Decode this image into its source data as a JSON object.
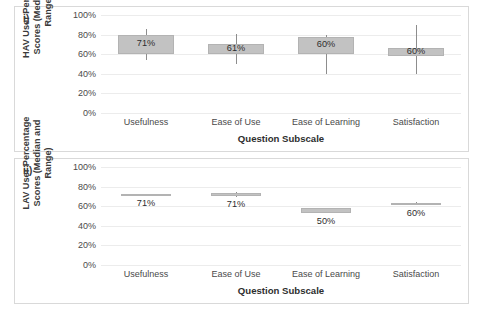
{
  "figure": {
    "background": "#ffffff",
    "box_fill": "#c2c2c2",
    "whisker_color": "#8d8d8d",
    "grid_color": "#ececec"
  },
  "panels": [
    {
      "tag": "i)",
      "y_title": "HAV User Percentage Scores (Median and Range)",
      "x_title": "Question Subscale",
      "chart_data": {
        "type": "bar",
        "subtype": "box-and-whisker",
        "title": "",
        "xlabel": "Question Subscale",
        "ylabel": "HAV User Percentage Scores (Median and Range)",
        "ylim": [
          0,
          100
        ],
        "yticks": [
          "0%",
          "20%",
          "40%",
          "60%",
          "80%",
          "100%"
        ],
        "ytick_values": [
          0,
          20,
          40,
          60,
          80,
          100
        ],
        "grid": true,
        "legend": "none",
        "categories": [
          "Usefulness",
          "Ease of Use",
          "Ease of Learning",
          "Satisfaction"
        ],
        "data_labels": [
          "71%",
          "61%",
          "60%",
          "60%"
        ],
        "values": [
          71,
          61,
          60,
          60
        ],
        "boxes": [
          {
            "category": "Usefulness",
            "box_low": 60,
            "box_high": 80,
            "whisker_low": 54,
            "whisker_high": 86,
            "label": "71%"
          },
          {
            "category": "Ease of Use",
            "box_low": 60,
            "box_high": 70,
            "whisker_low": 50,
            "whisker_high": 81,
            "label": "61%"
          },
          {
            "category": "Ease of Learning",
            "box_low": 60,
            "box_high": 78,
            "whisker_low": 40,
            "whisker_high": 80,
            "label": "60%"
          },
          {
            "category": "Satisfaction",
            "box_low": 58,
            "box_high": 66,
            "whisker_low": 40,
            "whisker_high": 90,
            "label": "60%"
          }
        ]
      }
    },
    {
      "tag": "ii)",
      "y_title": "LAV User Percentage Scores (Median and Range)",
      "x_title": "Question Subscale",
      "chart_data": {
        "type": "bar",
        "subtype": "box-and-whisker",
        "title": "",
        "xlabel": "Question Subscale",
        "ylabel": "LAV User Percentage Scores (Median and Range)",
        "ylim": [
          0,
          100
        ],
        "yticks": [
          "0%",
          "20%",
          "40%",
          "60%",
          "80%",
          "100%"
        ],
        "ytick_values": [
          0,
          20,
          40,
          60,
          80,
          100
        ],
        "grid": true,
        "legend": "none",
        "categories": [
          "Usefulness",
          "Ease of Use",
          "Ease of Learning",
          "Satisfaction"
        ],
        "data_labels": [
          "71%",
          "71%",
          "50%",
          "60%"
        ],
        "values": [
          71,
          71,
          50,
          60
        ],
        "boxes": [
          {
            "category": "Usefulness",
            "box_low": 71,
            "box_high": 72,
            "whisker_low": 71,
            "whisker_high": 72,
            "label": "71%"
          },
          {
            "category": "Ease of Use",
            "box_low": 70,
            "box_high": 73,
            "whisker_low": 69,
            "whisker_high": 75,
            "label": "71%"
          },
          {
            "category": "Ease of Learning",
            "box_low": 53,
            "box_high": 58,
            "whisker_low": 53,
            "whisker_high": 58,
            "label": "50%"
          },
          {
            "category": "Satisfaction",
            "box_low": 61,
            "box_high": 63,
            "whisker_low": 61,
            "whisker_high": 64,
            "label": "60%"
          }
        ]
      }
    }
  ]
}
